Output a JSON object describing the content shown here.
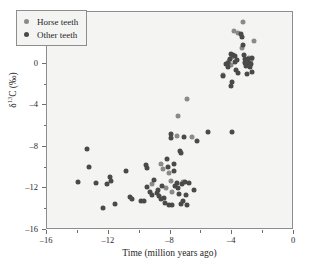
{
  "chart_data": {
    "type": "scatter",
    "title": "",
    "xlabel": "Time (million years ago)",
    "ylabel": "δ¹³C (‰)",
    "xlim": [
      -16,
      0
    ],
    "ylim": [
      -16,
      5
    ],
    "xticks": [
      -16,
      -12,
      -8,
      -4,
      0
    ],
    "xtick_labels": [
      "–16",
      "–12",
      "–8",
      "–4",
      "0"
    ],
    "yticks": [
      4,
      0,
      -4,
      -8,
      -12,
      -16
    ],
    "ytick_labels": [
      "4",
      "0",
      "–4",
      "–8",
      "–12",
      "–16"
    ],
    "x_minor_ticks": [
      -14,
      -10,
      -6,
      -2
    ],
    "y_minor_ticks": [
      2,
      -2,
      -6,
      -10,
      -14
    ],
    "grid": false,
    "legend_position": "upper-left-inside",
    "colors": {
      "horse_teeth": "#8a8a8a",
      "other_teeth": "#4a4a4a",
      "plot_background": "#f4f4f2",
      "frame": "#8d8d8d",
      "page_background": "#ffffff"
    },
    "series": [
      {
        "name": "Horse teeth",
        "marker": "circle",
        "color": "#8a8a8a",
        "points": [
          [
            -8.6,
            -9.6
          ],
          [
            -8.5,
            -10.1
          ],
          [
            -8.3,
            -12.0
          ],
          [
            -8.1,
            -10.5
          ],
          [
            -8.0,
            -11.3
          ],
          [
            -7.9,
            -12.3
          ],
          [
            -7.6,
            -6.9
          ],
          [
            -7.5,
            -5.0
          ],
          [
            -6.9,
            -3.4
          ],
          [
            -7.2,
            -11.4
          ],
          [
            -6.6,
            -7.0
          ],
          [
            -9.2,
            -11.6
          ],
          [
            -4.6,
            -1.1
          ],
          [
            -4.1,
            -0.1
          ],
          [
            -3.9,
            3.2
          ],
          [
            -3.6,
            3.0
          ],
          [
            -3.4,
            1.5
          ],
          [
            -3.3,
            4.0
          ],
          [
            -2.9,
            0.6
          ],
          [
            -2.6,
            2.2
          ],
          [
            -4.0,
            0.7
          ],
          [
            -4.2,
            0.3
          ],
          [
            -3.2,
            0.2
          ],
          [
            -2.8,
            0.4
          ]
        ]
      },
      {
        "name": "Other teeth",
        "marker": "circle",
        "color": "#4a4a4a",
        "points": [
          [
            -13.4,
            -8.2
          ],
          [
            -13.3,
            -9.9
          ],
          [
            -14.0,
            -11.4
          ],
          [
            -12.8,
            -11.5
          ],
          [
            -12.4,
            -13.9
          ],
          [
            -12.1,
            -11.6
          ],
          [
            -11.9,
            -10.9
          ],
          [
            -11.85,
            -11.3
          ],
          [
            -11.6,
            -13.5
          ],
          [
            -10.9,
            -10.3
          ],
          [
            -10.6,
            -12.8
          ],
          [
            -10.5,
            -13.0
          ],
          [
            -9.9,
            -13.2
          ],
          [
            -9.7,
            -13.2
          ],
          [
            -9.6,
            -9.7
          ],
          [
            -9.55,
            -10.0
          ],
          [
            -9.5,
            -11.9
          ],
          [
            -9.3,
            -12.3
          ],
          [
            -9.2,
            -12.6
          ],
          [
            -9.1,
            -11.2
          ],
          [
            -8.9,
            -12.4
          ],
          [
            -8.8,
            -12.1
          ],
          [
            -8.75,
            -12.7
          ],
          [
            -8.6,
            -13.0
          ],
          [
            -8.55,
            -11.8
          ],
          [
            -8.4,
            -12.9
          ],
          [
            -8.35,
            -13.4
          ],
          [
            -8.2,
            -9.2
          ],
          [
            -8.15,
            -9.9
          ],
          [
            -8.1,
            -13.6
          ],
          [
            -8.0,
            -6.8
          ],
          [
            -7.95,
            -7.1
          ],
          [
            -7.9,
            -13.6
          ],
          [
            -7.8,
            -10.3
          ],
          [
            -7.75,
            -9.6
          ],
          [
            -7.7,
            -11.8
          ],
          [
            -7.6,
            -11.5
          ],
          [
            -7.5,
            -12.0
          ],
          [
            -7.45,
            -12.5
          ],
          [
            -7.4,
            -8.4
          ],
          [
            -7.35,
            -8.6
          ],
          [
            -7.3,
            -13.5
          ],
          [
            -7.25,
            -11.6
          ],
          [
            -7.2,
            -13.2
          ],
          [
            -7.1,
            -7.0
          ],
          [
            -7.05,
            -11.4
          ],
          [
            -7.0,
            -12.6
          ],
          [
            -6.9,
            -13.6
          ],
          [
            -6.8,
            -11.5
          ],
          [
            -6.5,
            -12.1
          ],
          [
            -6.3,
            -7.4
          ],
          [
            -5.6,
            -6.6
          ],
          [
            -4.0,
            -6.6
          ],
          [
            -4.6,
            -1.2
          ],
          [
            -4.3,
            0.1
          ],
          [
            -4.25,
            -0.3
          ],
          [
            -4.15,
            0.5
          ],
          [
            -4.05,
            1.0
          ],
          [
            -3.95,
            0.9
          ],
          [
            -4.0,
            -1.7
          ],
          [
            -4.1,
            -2.1
          ],
          [
            -3.85,
            0.8
          ],
          [
            -3.8,
            0.2
          ],
          [
            -3.75,
            -0.6
          ],
          [
            -3.7,
            0.4
          ],
          [
            -3.35,
            2.6
          ],
          [
            -3.3,
            1.8
          ],
          [
            -3.25,
            0.9
          ],
          [
            -3.2,
            0.5
          ],
          [
            -3.15,
            0.1
          ],
          [
            -3.1,
            -0.2
          ],
          [
            -3.05,
            -1.0
          ],
          [
            -2.95,
            0.5
          ],
          [
            -2.9,
            0.1
          ],
          [
            -2.85,
            -0.3
          ],
          [
            -2.8,
            0.0
          ],
          [
            -2.75,
            0.6
          ],
          [
            -2.7,
            -0.8
          ],
          [
            -3.45,
            2.9
          ],
          [
            -4.4,
            0.0
          ],
          [
            -3.6,
            -0.9
          ]
        ]
      }
    ]
  },
  "legend": {
    "entries": [
      {
        "label": "Horse teeth",
        "color": "#8a8a8a"
      },
      {
        "label": "Other teeth",
        "color": "#4a4a4a"
      }
    ]
  }
}
